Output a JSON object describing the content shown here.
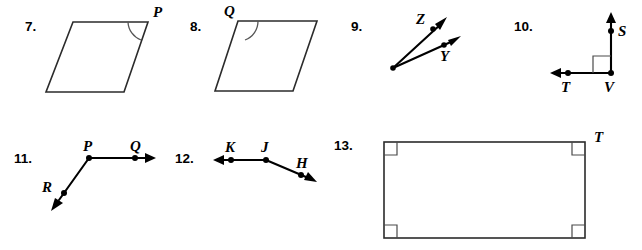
{
  "page": {
    "background_color": "#ffffff",
    "ink_color": "#000000",
    "figure_stroke_color": "#2b2b2b",
    "width": 642,
    "height": 250
  },
  "problems": [
    {
      "number": "7.",
      "figure_type": "parallelogram",
      "labels": [
        "P"
      ],
      "angle_marked_at": "P",
      "description": "Parallelogram with angle arc marked at vertex P (upper right)"
    },
    {
      "number": "8.",
      "figure_type": "parallelogram",
      "labels": [
        "Q"
      ],
      "angle_marked_at": "Q",
      "description": "Parallelogram with angle arc marked at vertex Q (upper left)"
    },
    {
      "number": "9.",
      "figure_type": "two-rays-angle",
      "labels": [
        "Z",
        "Y"
      ],
      "description": "Angle formed by two rays from a common endpoint passing through Z and Y"
    },
    {
      "number": "10.",
      "figure_type": "right-angle-rays",
      "labels": [
        "S",
        "T",
        "V"
      ],
      "angle_marked_at": "V",
      "description": "Ray VS pointing up and ray VT pointing left, right angle square at V"
    },
    {
      "number": "11.",
      "figure_type": "two-rays-angle",
      "labels": [
        "P",
        "Q",
        "R"
      ],
      "description": "Ray PQ pointing right and ray PR pointing down-left from vertex P"
    },
    {
      "number": "12.",
      "figure_type": "two-rays-angle",
      "labels": [
        "K",
        "J",
        "H"
      ],
      "description": "Ray JK pointing left and ray JH pointing down-right from vertex J"
    },
    {
      "number": "13.",
      "figure_type": "rectangle",
      "labels": [
        "T"
      ],
      "corner_marks": "four right-angle squares",
      "description": "Rectangle with right angle squares at all four corners, vertex T at upper right"
    }
  ],
  "figure_labels": {
    "p7_num": "7.",
    "p7_P": "P",
    "p8_num": "8.",
    "p8_Q": "Q",
    "p9_num": "9.",
    "p9_Z": "Z",
    "p9_Y": "Y",
    "p10_num": "10.",
    "p10_S": "S",
    "p10_T": "T",
    "p10_V": "V",
    "p11_num": "11.",
    "p11_P": "P",
    "p11_Q": "Q",
    "p11_R": "R",
    "p12_num": "12.",
    "p12_K": "K",
    "p12_J": "J",
    "p12_H": "H",
    "p13_num": "13.",
    "p13_T": "T"
  }
}
